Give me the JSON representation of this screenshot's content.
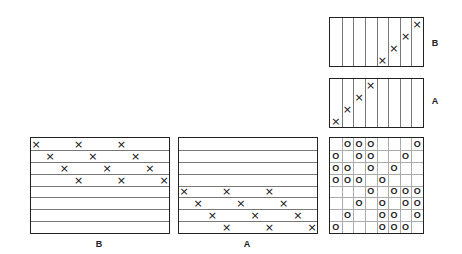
{
  "panels": {
    "horizontal_B": {
      "label": "B",
      "rows": 8,
      "marks": [
        [
          0,
          0
        ],
        [
          0,
          3
        ],
        [
          0,
          6
        ],
        [
          1,
          1
        ],
        [
          1,
          4
        ],
        [
          1,
          7
        ],
        [
          2,
          2
        ],
        [
          2,
          5
        ],
        [
          2,
          8
        ],
        [
          3,
          3
        ],
        [
          3,
          6
        ],
        [
          3,
          9
        ]
      ],
      "mark_glyph": "×"
    },
    "horizontal_A": {
      "label": "A",
      "rows": 8,
      "marks": [
        [
          4,
          0
        ],
        [
          4,
          3
        ],
        [
          4,
          6
        ],
        [
          5,
          1
        ],
        [
          5,
          4
        ],
        [
          5,
          7
        ],
        [
          6,
          2
        ],
        [
          6,
          5
        ],
        [
          6,
          8
        ],
        [
          7,
          3
        ],
        [
          7,
          6
        ],
        [
          7,
          9
        ]
      ],
      "mark_glyph": "×"
    },
    "vertical_B": {
      "label": "B",
      "columns": 8,
      "marks": [
        [
          4,
          3
        ],
        [
          5,
          2
        ],
        [
          6,
          1
        ],
        [
          7,
          0
        ]
      ],
      "mark_glyph": "×"
    },
    "vertical_A": {
      "label": "A",
      "columns": 8,
      "marks": [
        [
          0,
          3
        ],
        [
          1,
          2
        ],
        [
          2,
          1
        ],
        [
          3,
          0
        ]
      ],
      "mark_glyph": "×"
    },
    "grid": {
      "rows": 8,
      "columns": 8,
      "mark_glyph": "O",
      "cells": [
        [
          0,
          1,
          1,
          1,
          0,
          0,
          0,
          1
        ],
        [
          1,
          0,
          1,
          1,
          0,
          0,
          1,
          0
        ],
        [
          1,
          1,
          0,
          1,
          0,
          1,
          0,
          0
        ],
        [
          1,
          1,
          1,
          0,
          1,
          0,
          0,
          0
        ],
        [
          0,
          0,
          0,
          1,
          0,
          1,
          1,
          1
        ],
        [
          0,
          0,
          1,
          0,
          1,
          0,
          1,
          1
        ],
        [
          0,
          1,
          0,
          0,
          1,
          1,
          0,
          1
        ],
        [
          1,
          0,
          0,
          0,
          1,
          1,
          1,
          0
        ]
      ]
    }
  }
}
